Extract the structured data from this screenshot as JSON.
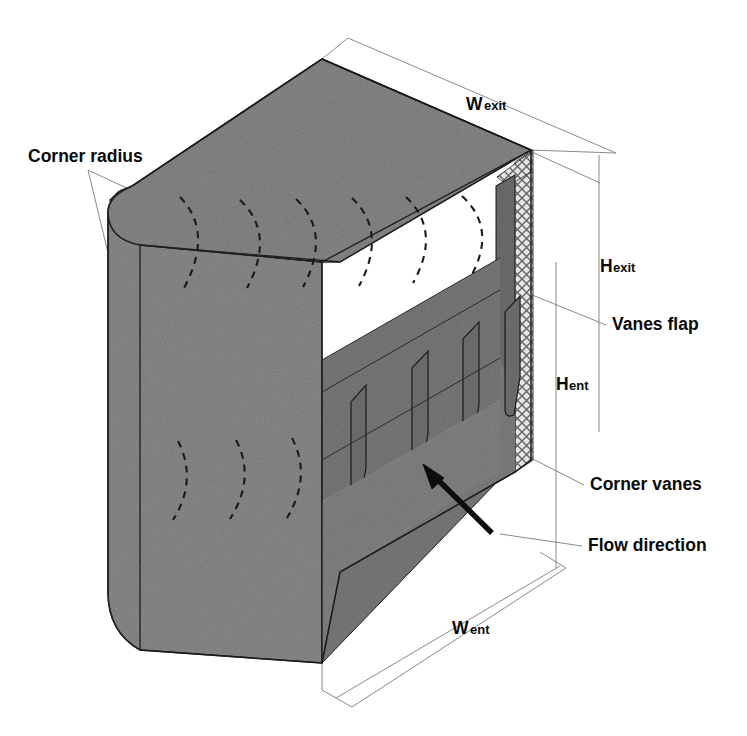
{
  "figure": {
    "type": "technical-isometric-diagram",
    "background_color": "#ffffff",
    "body_fill_color": "#878787",
    "body_fill_dark": "#6f6f6f",
    "edge_color": "#1c1c1c",
    "dimension_line_color": "#8a8a8a",
    "mesh_color": "#d8d8d8",
    "label_color": "#0a0a0a"
  },
  "labels": {
    "corner_radius": "Corner radius",
    "w_exit": {
      "base": "W",
      "sub": "exit"
    },
    "h_exit": {
      "base": "H",
      "sub": "exit"
    },
    "vanes_flap": "Vanes flap",
    "h_ent": {
      "base": "H",
      "sub": "ent"
    },
    "corner_vanes": "Corner vanes",
    "flow_direction": "Flow direction",
    "w_ent": {
      "base": "W",
      "sub": "ent"
    }
  },
  "annotations": [
    {
      "name": "corner-radius-label",
      "text": "Corner radius",
      "x": 28,
      "y": 162,
      "leaders": 2
    },
    {
      "name": "w-exit-label",
      "text": "Wexit",
      "x": 466,
      "y": 110,
      "dimension": "width at exit plane"
    },
    {
      "name": "h-exit-label",
      "text": "Hexit",
      "x": 600,
      "y": 272,
      "dimension": "height at exit plane"
    },
    {
      "name": "vanes-flap-label",
      "text": "Vanes flap",
      "x": 612,
      "y": 330,
      "leaders": 1
    },
    {
      "name": "h-ent-label",
      "text": "Hent",
      "x": 557,
      "y": 390,
      "dimension": "height at entrance plane"
    },
    {
      "name": "corner-vanes-label",
      "text": "Corner vanes",
      "x": 590,
      "y": 490,
      "leaders": 1
    },
    {
      "name": "flow-direction-label",
      "text": "Flow direction",
      "x": 588,
      "y": 551,
      "leaders": 1
    },
    {
      "name": "w-ent-label",
      "text": "Went",
      "x": 457,
      "y": 634,
      "dimension": "width at entrance plane"
    }
  ],
  "features": {
    "top_face_vane_arcs": 6,
    "left_face_vane_arcs": 3,
    "corner_vane_blades": 4,
    "mesh_panels": 2,
    "flow_arrow": {
      "from_x": 492,
      "from_y": 533,
      "to_x": 423,
      "to_y": 466
    }
  }
}
